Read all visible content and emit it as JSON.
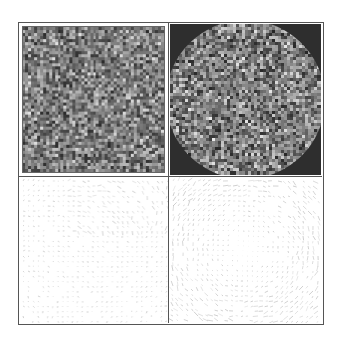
{
  "figure": {
    "layout": "2x2 grid",
    "frame_color": "#555555",
    "background": "#ffffff",
    "panels": [
      {
        "id": "top-left",
        "kind": "noise",
        "mask": "square",
        "grid": 48,
        "seed": 11,
        "dark": "#2a2a2a",
        "light": "#e8e8e8",
        "mask_color": "#2a2a2a"
      },
      {
        "id": "top-right",
        "kind": "noise",
        "mask": "circle",
        "grid": 50,
        "seed": 29,
        "dark": "#262626",
        "light": "#f0f0f0",
        "mask_color": "#2e2e2e"
      },
      {
        "id": "bottom-left",
        "kind": "vector-field",
        "pattern": "diagonal-flow",
        "seed": 7,
        "stroke": "#9a9a9a"
      },
      {
        "id": "bottom-right",
        "kind": "vector-field",
        "pattern": "vortex",
        "seed": 43,
        "stroke": "#9a9a9a"
      }
    ]
  }
}
